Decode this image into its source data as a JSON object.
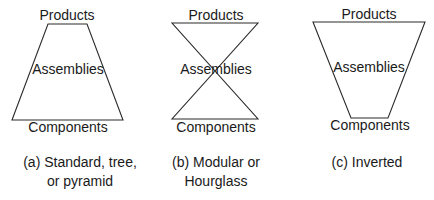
{
  "diagrams": [
    {
      "id": "a",
      "shape": "trapezoid",
      "top_label": "Products",
      "middle_label": "Assemblies",
      "bottom_label": "Components",
      "caption_lines": [
        "(a) Standard, tree,",
        "or pyramid"
      ]
    },
    {
      "id": "b",
      "shape": "hourglass",
      "top_label": "Products",
      "middle_label": "Assemblies",
      "bottom_label": "Components",
      "caption_lines": [
        "(b) Modular or",
        "Hourglass"
      ]
    },
    {
      "id": "c",
      "shape": "inverted-trapezoid",
      "top_label": "Products",
      "middle_label": "Assemblies",
      "bottom_label": "Components",
      "caption_lines": [
        "(c) Inverted"
      ]
    }
  ],
  "colors": {
    "stroke": "#2a2a2a",
    "text": "#1a1a1a",
    "background": "#ffffff"
  }
}
